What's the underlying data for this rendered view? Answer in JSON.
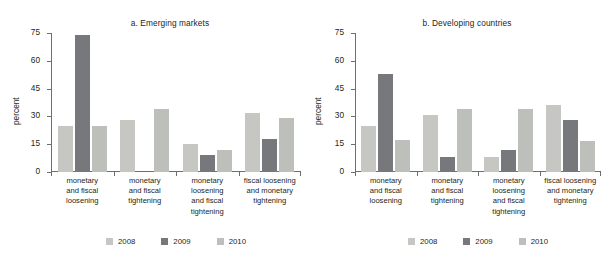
{
  "figure": {
    "background": "#ffffff",
    "axis_color": "#6d6e71",
    "text_color": "#231f20"
  },
  "series_colors": {
    "2008": "#c6c7c3",
    "2009": "#77787b",
    "2010": "#bdbfbb"
  },
  "legend": {
    "items": [
      {
        "label": "2008",
        "color": "#c6c7c3"
      },
      {
        "label": "2009",
        "color": "#77787b"
      },
      {
        "label": "2010",
        "color": "#bdbfbb"
      }
    ]
  },
  "chart_data": [
    {
      "type": "bar",
      "title": "a.  Emerging markets",
      "xlabel": "",
      "ylabel": "percent",
      "ylim": [
        0,
        75
      ],
      "yticks": [
        0,
        15,
        30,
        45,
        60,
        75
      ],
      "ytick_labels": [
        "0",
        "15",
        "30",
        "45",
        "60",
        "75"
      ],
      "grid": false,
      "legend_position": "bottom",
      "categories": [
        "monetary and fiscal loosening",
        "monetary and fiscal tightening",
        "monetary loosening and fiscal tightening",
        "fiscal loosening and monetary tightening"
      ],
      "series": [
        {
          "name": "2008",
          "values": [
            25,
            28,
            15,
            32
          ]
        },
        {
          "name": "2009",
          "values": [
            74,
            0,
            9,
            18
          ]
        },
        {
          "name": "2010",
          "values": [
            25,
            34,
            12,
            29
          ]
        }
      ]
    },
    {
      "type": "bar",
      "title": "b.  Developing countries",
      "xlabel": "",
      "ylabel": "percent",
      "ylim": [
        0,
        75
      ],
      "yticks": [
        0,
        15,
        30,
        45,
        60,
        75
      ],
      "ytick_labels": [
        "0",
        "15",
        "30",
        "45",
        "60",
        "75"
      ],
      "grid": false,
      "legend_position": "bottom",
      "categories": [
        "monetary and fiscal loosening",
        "monetary and fiscal tightening",
        "monetary loosening and fiscal tightening",
        "fiscal loosening and monetary tightening"
      ],
      "series": [
        {
          "name": "2008",
          "values": [
            25,
            31,
            8,
            36
          ]
        },
        {
          "name": "2009",
          "values": [
            53,
            8,
            12,
            28
          ]
        },
        {
          "name": "2010",
          "values": [
            17.5,
            34,
            34,
            16.5
          ]
        }
      ]
    }
  ],
  "panel_a": {
    "title": "a.  Emerging markets",
    "ylabel": "percent",
    "categories": [
      "monetary\nand fiscal\nloosening",
      "monetary\nand fiscal\ntightening",
      "monetary\nloosening\nand fiscal\ntightening",
      "fiscal loosening\nand monetary\ntightening"
    ],
    "cat0": "monetary and fiscal loosening",
    "cat1": "monetary and fiscal tightening",
    "cat2": "monetary loosening and fiscal tightening",
    "cat3": "fiscal loosening and monetary tightening",
    "yticks": [
      "75",
      "60",
      "45",
      "30",
      "15",
      "0"
    ]
  },
  "panel_b": {
    "title": "b.  Developing countries",
    "ylabel": "percent",
    "cat0": "monetary and fiscal loosening",
    "cat1": "monetary and fiscal tightening",
    "cat2": "monetary loosening and fiscal tightening",
    "cat3": "fiscal loosening and monetary tightening",
    "yticks": [
      "75",
      "60",
      "45",
      "30",
      "15",
      "0"
    ]
  }
}
